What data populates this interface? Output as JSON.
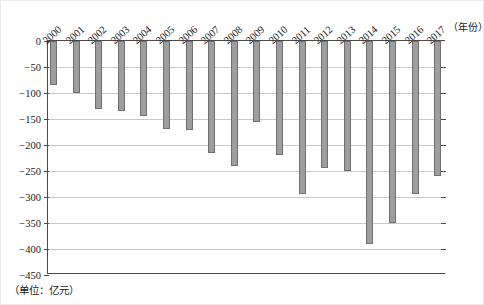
{
  "figure": {
    "x_axis_title": "（年份）",
    "unit_note": "（单位：亿元）"
  },
  "chart_data": {
    "type": "bar",
    "title": "",
    "subtitle": "",
    "xlabel": "（年份）",
    "ylabel": "（单位：亿元）",
    "ylim": [
      -450,
      0
    ],
    "ytick_step": 50,
    "grid": true,
    "legend": "none",
    "orientation": "vertical",
    "bar_color": "#9e9e9e",
    "bar_edge_color": "#6f6f6f",
    "axis_color": "#4a4a4a",
    "grid_color": "#c9c9c9",
    "yticks": [
      0,
      -50,
      -100,
      -150,
      -200,
      -250,
      -300,
      -350,
      -400,
      -450
    ],
    "ytick_labels": [
      "0",
      "−50",
      "−100",
      "−150",
      "−200",
      "−250",
      "−300",
      "−350",
      "−400",
      "−450"
    ],
    "categories": [
      "2000",
      "2001",
      "2002",
      "2003",
      "2004",
      "2005",
      "2006",
      "2007",
      "2008",
      "2009",
      "2010",
      "2011",
      "2012",
      "2013",
      "2014",
      "2015",
      "2016",
      "2017"
    ],
    "values": [
      -85,
      -100,
      -130,
      -135,
      -145,
      -170,
      -172,
      -215,
      -240,
      -155,
      -220,
      -295,
      -245,
      -250,
      -390,
      -350,
      -295,
      -260
    ]
  }
}
